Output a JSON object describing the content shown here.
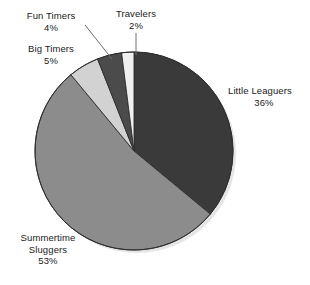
{
  "chart_data": {
    "type": "pie",
    "title": "",
    "subtitle": "",
    "xlabel": "",
    "ylabel": "",
    "legend_position": "none",
    "grid": false,
    "start_angle_deg": 0,
    "direction": "clockwise",
    "categories": [
      "Little Leaguers",
      "Summertime Sluggers",
      "Big Timers",
      "Fun Timers",
      "Travelers"
    ],
    "values": [
      36,
      53,
      5,
      4,
      2
    ],
    "value_unit": "%",
    "colors": [
      "#3a3a3a",
      "#8c8c8c",
      "#d2d2d2",
      "#4b4b4b",
      "#f0f0f0"
    ],
    "slices": [
      {
        "name": "Little Leaguers",
        "value": 36,
        "value_label": "36%",
        "color": "#3a3a3a",
        "start_deg": 0,
        "end_deg": 129.6
      },
      {
        "name": "Summertime Sluggers",
        "value": 53,
        "value_label": "53%",
        "color": "#8c8c8c",
        "start_deg": 129.6,
        "end_deg": 320.4
      },
      {
        "name": "Big Timers",
        "value": 5,
        "value_label": "5%",
        "color": "#d2d2d2",
        "start_deg": 320.4,
        "end_deg": 338.4
      },
      {
        "name": "Fun Timers",
        "value": 4,
        "value_label": "4%",
        "color": "#4b4b4b",
        "start_deg": 338.4,
        "end_deg": 352.8
      },
      {
        "name": "Travelers",
        "value": 2,
        "value_label": "2%",
        "color": "#f0f0f0",
        "start_deg": 352.8,
        "end_deg": 360
      }
    ]
  },
  "labels": {
    "fun_timers": {
      "name": "Fun Timers",
      "value": "4%"
    },
    "big_timers": {
      "name": "Big Timers",
      "value": "5%"
    },
    "travelers": {
      "name": "Travelers",
      "value": "2%"
    },
    "little_leaguers": {
      "name": "Little Leaguers",
      "value": "36%"
    },
    "summertime_sluggers": {
      "name_line1": "Summertime",
      "name_line2": "Sluggers",
      "value": "53%"
    }
  },
  "geometry": {
    "center_x": 134,
    "center_y": 151,
    "radius": 99
  },
  "colors": {
    "background": "#ffffff",
    "text": "#1a1a1a",
    "slice_outline": "#2e2e2e",
    "leader_line": "#707070",
    "shadow": "#d8d8d8"
  }
}
